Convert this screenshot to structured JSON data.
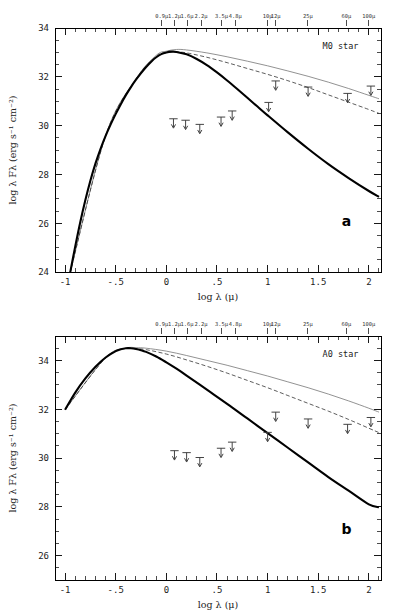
{
  "figure": {
    "panels": [
      "a",
      "b"
    ]
  },
  "axis": {
    "xlabel": "log λ (μ)",
    "ylabel": "log λ Fλ  (erg s⁻¹ cm⁻²)",
    "x_ticks": [
      "-1",
      "-.5",
      "0",
      ".5",
      "1",
      "1.5",
      "2"
    ],
    "x_tick_values": [
      -1,
      -0.5,
      0,
      0.5,
      1,
      1.5,
      2
    ],
    "top_axis_labels": [
      "0.9μ",
      "1.2μ",
      "1.6μ",
      "2.2μ",
      "3.5μ",
      "4.8μ",
      "10μ",
      "12μ",
      "25μ",
      "60μ",
      "100μ"
    ],
    "top_axis_wavelengths_micron": [
      0.9,
      1.2,
      1.6,
      2.2,
      3.5,
      4.8,
      10,
      12,
      25,
      60,
      100
    ]
  },
  "panel_a": {
    "letter": "a",
    "star_label": "M0 star",
    "y_ticks": [
      "24",
      "26",
      "28",
      "30",
      "32",
      "34"
    ],
    "y_tick_values": [
      24,
      26,
      28,
      30,
      32,
      34
    ]
  },
  "panel_b": {
    "letter": "b",
    "star_label": "A0 star",
    "y_ticks": [
      "26",
      "28",
      "30",
      "32",
      "34"
    ],
    "y_tick_values": [
      26,
      28,
      30,
      32,
      34
    ]
  },
  "chart_data": [
    {
      "type": "line",
      "panel": "a",
      "title": "M0 star",
      "xlabel": "log λ (μ)",
      "ylabel": "log λ Fλ  (erg s⁻¹ cm⁻²)",
      "xlim": [
        -1.1,
        2.12
      ],
      "ylim": [
        24,
        34
      ],
      "grid": false,
      "legend": "none",
      "series": [
        {
          "name": "photosphere (thick solid)",
          "style": "thick-solid",
          "color": "#000000",
          "x": [
            -0.95,
            -0.9,
            -0.85,
            -0.8,
            -0.75,
            -0.7,
            -0.65,
            -0.6,
            -0.55,
            -0.5,
            -0.45,
            -0.4,
            -0.35,
            -0.3,
            -0.25,
            -0.2,
            -0.15,
            -0.1,
            -0.05,
            0.0,
            0.05,
            0.1,
            0.2,
            0.3,
            0.4,
            0.5,
            0.6,
            0.7,
            0.8,
            0.9,
            1.0,
            1.2,
            1.4,
            1.6,
            1.8,
            2.0,
            2.1
          ],
          "y": [
            23.98,
            25.05,
            26.05,
            26.95,
            27.75,
            28.45,
            29.05,
            29.58,
            30.05,
            30.48,
            30.88,
            31.25,
            31.58,
            31.88,
            32.15,
            32.4,
            32.62,
            32.8,
            32.93,
            33.0,
            33.03,
            33.02,
            32.92,
            32.73,
            32.48,
            32.18,
            31.85,
            31.5,
            31.14,
            30.78,
            30.42,
            29.72,
            29.05,
            28.42,
            27.85,
            27.32,
            27.08
          ]
        },
        {
          "name": "disk model upper (thin solid)",
          "style": "thin-solid",
          "color": "#6e6e6e",
          "x": [
            -0.95,
            -0.6,
            -0.3,
            -0.1,
            0.0,
            0.1,
            0.2,
            0.4,
            0.6,
            0.8,
            1.0,
            1.2,
            1.4,
            1.6,
            1.8,
            2.0,
            2.1
          ],
          "y": [
            23.98,
            29.6,
            31.92,
            32.88,
            33.05,
            33.12,
            33.1,
            32.98,
            32.82,
            32.64,
            32.45,
            32.24,
            32.02,
            31.78,
            31.52,
            31.24,
            31.1
          ]
        },
        {
          "name": "disk model middle (dashed)",
          "style": "dashed",
          "color": "#333333",
          "x": [
            -0.95,
            -0.6,
            -0.3,
            -0.1,
            0.0,
            0.1,
            0.2,
            0.4,
            0.6,
            0.8,
            1.0,
            1.2,
            1.4,
            1.6,
            1.8,
            2.0,
            2.1
          ],
          "y": [
            23.98,
            29.58,
            31.9,
            32.84,
            32.99,
            33.02,
            32.98,
            32.8,
            32.58,
            32.34,
            32.1,
            31.84,
            31.56,
            31.26,
            30.96,
            30.66,
            30.5
          ]
        }
      ],
      "upper_limits": [
        {
          "label": "0.9μ",
          "x": 0.07,
          "y": 30.28
        },
        {
          "label": "1.2μ",
          "x": 0.19,
          "y": 30.22
        },
        {
          "label": "1.6μ",
          "x": 0.33,
          "y": 30.05
        },
        {
          "label": "2.2μ",
          "x": 0.54,
          "y": 30.35
        },
        {
          "label": "3.5μ",
          "x": 0.65,
          "y": 30.6
        },
        {
          "label": "10μ",
          "x": 1.01,
          "y": 30.95
        },
        {
          "label": "12μ",
          "x": 1.08,
          "y": 31.83
        },
        {
          "label": "25μ",
          "x": 1.4,
          "y": 31.58
        },
        {
          "label": "60μ",
          "x": 1.79,
          "y": 31.32
        },
        {
          "label": "100μ",
          "x": 2.02,
          "y": 31.62
        }
      ]
    },
    {
      "type": "line",
      "panel": "b",
      "title": "A0 star",
      "xlabel": "log λ (μ)",
      "ylabel": "log λ Fλ  (erg s⁻¹ cm⁻²)",
      "xlim": [
        -1.1,
        2.12
      ],
      "ylim": [
        25,
        35
      ],
      "grid": false,
      "legend": "none",
      "series": [
        {
          "name": "photosphere (thick solid)",
          "style": "thick-solid",
          "color": "#000000",
          "x": [
            -1.0,
            -0.9,
            -0.8,
            -0.7,
            -0.6,
            -0.5,
            -0.45,
            -0.4,
            -0.35,
            -0.3,
            -0.25,
            -0.2,
            -0.1,
            0.0,
            0.1,
            0.2,
            0.4,
            0.6,
            0.8,
            1.0,
            1.2,
            1.4,
            1.6,
            1.8,
            2.0,
            2.1
          ],
          "y": [
            31.98,
            32.68,
            33.26,
            33.74,
            34.12,
            34.38,
            34.46,
            34.5,
            34.5,
            34.47,
            34.42,
            34.35,
            34.16,
            33.92,
            33.66,
            33.38,
            32.8,
            32.22,
            31.62,
            31.02,
            30.42,
            29.82,
            29.22,
            28.66,
            28.1,
            27.98
          ]
        },
        {
          "name": "disk model upper (thin solid)",
          "style": "thin-solid",
          "color": "#6e6e6e",
          "x": [
            -1.0,
            -0.6,
            -0.4,
            -0.3,
            -0.2,
            0.0,
            0.2,
            0.4,
            0.6,
            0.8,
            1.0,
            1.2,
            1.4,
            1.6,
            1.8,
            2.0,
            2.1
          ],
          "y": [
            31.98,
            34.12,
            34.5,
            34.52,
            34.5,
            34.38,
            34.2,
            34.0,
            33.8,
            33.58,
            33.36,
            33.12,
            32.88,
            32.62,
            32.34,
            32.04,
            31.88
          ]
        },
        {
          "name": "disk model middle (dashed)",
          "style": "dashed",
          "color": "#333333",
          "x": [
            -1.0,
            -0.6,
            -0.4,
            -0.3,
            -0.2,
            0.0,
            0.2,
            0.4,
            0.6,
            0.8,
            1.0,
            1.2,
            1.4,
            1.6,
            1.8,
            2.0,
            2.1
          ],
          "y": [
            31.98,
            34.1,
            34.48,
            34.48,
            34.44,
            34.26,
            34.02,
            33.76,
            33.48,
            33.18,
            32.88,
            32.56,
            32.24,
            31.92,
            31.58,
            31.22,
            31.04
          ]
        }
      ],
      "upper_limits": [
        {
          "label": "0.9μ",
          "x": 0.08,
          "y": 30.3
        },
        {
          "label": "1.2μ",
          "x": 0.2,
          "y": 30.22
        },
        {
          "label": "1.6μ",
          "x": 0.33,
          "y": 30.02
        },
        {
          "label": "2.2μ",
          "x": 0.54,
          "y": 30.4
        },
        {
          "label": "3.5μ",
          "x": 0.65,
          "y": 30.65
        },
        {
          "label": "10μ",
          "x": 1.0,
          "y": 31.05
        },
        {
          "label": "12μ",
          "x": 1.08,
          "y": 31.88
        },
        {
          "label": "25μ",
          "x": 1.4,
          "y": 31.6
        },
        {
          "label": "60μ",
          "x": 1.79,
          "y": 31.38
        },
        {
          "label": "100μ",
          "x": 2.02,
          "y": 31.66
        }
      ]
    }
  ]
}
